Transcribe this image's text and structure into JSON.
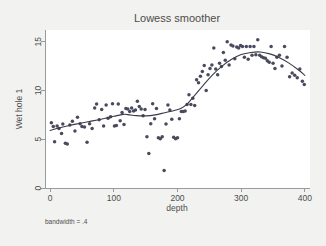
{
  "chart_data": {
    "type": "scatter",
    "title": "Lowess smoother",
    "xlabel": "depth",
    "ylabel": "Wet hole 1",
    "note": "bandwidth = .4",
    "xlim": [
      -8,
      408
    ],
    "ylim": [
      0,
      16.2
    ],
    "xticks": [
      0,
      100,
      200,
      300,
      400
    ],
    "yticks": [
      0,
      5,
      10,
      15
    ],
    "xtick_labels": [
      "0",
      "100",
      "200",
      "300",
      "400"
    ],
    "ytick_labels": [
      "0",
      "5",
      "10",
      "15"
    ],
    "grid": false,
    "legend": "none",
    "marker_color": "#4a4a5e",
    "line_color": "#3a3a4a",
    "background_color": "#f2f2f0",
    "plot_background_color": "#ffffff",
    "axis_color": "#9a9a9a",
    "series": [
      {
        "name": "Wet hole 1",
        "type": "scatter",
        "points": [
          [
            2,
            6.7
          ],
          [
            5,
            6.3
          ],
          [
            7,
            4.75
          ],
          [
            11,
            6.35
          ],
          [
            14,
            6.1
          ],
          [
            18,
            5.6
          ],
          [
            20,
            6.55
          ],
          [
            24,
            4.6
          ],
          [
            27,
            4.5
          ],
          [
            31,
            6.45
          ],
          [
            35,
            6.85
          ],
          [
            39,
            5.85
          ],
          [
            43,
            7.25
          ],
          [
            47,
            6.6
          ],
          [
            50,
            6.3
          ],
          [
            54,
            6.25
          ],
          [
            58,
            4.7
          ],
          [
            62,
            6.6
          ],
          [
            66,
            6.1
          ],
          [
            70,
            8.2
          ],
          [
            73,
            8.6
          ],
          [
            77,
            7.0
          ],
          [
            81,
            8.05
          ],
          [
            84,
            6.35
          ],
          [
            88,
            8.5
          ],
          [
            91,
            7.15
          ],
          [
            95,
            7.3
          ],
          [
            98,
            8.65
          ],
          [
            101,
            6.35
          ],
          [
            104,
            6.4
          ],
          [
            107,
            8.6
          ],
          [
            110,
            6.9
          ],
          [
            113,
            7.75
          ],
          [
            116,
            6.5
          ],
          [
            119,
            8.15
          ],
          [
            122,
            8.1
          ],
          [
            125,
            7.85
          ],
          [
            128,
            8.2
          ],
          [
            131,
            7.9
          ],
          [
            134,
            8.0
          ],
          [
            137,
            8.9
          ],
          [
            140,
            8.35
          ],
          [
            143,
            8.1
          ],
          [
            146,
            7.4
          ],
          [
            149,
            8.05
          ],
          [
            152,
            5.25
          ],
          [
            155,
            3.55
          ],
          [
            158,
            6.6
          ],
          [
            161,
            8.65
          ],
          [
            164,
            7.1
          ],
          [
            167,
            8.15
          ],
          [
            170,
            5.15
          ],
          [
            173,
            5.05
          ],
          [
            176,
            5.25
          ],
          [
            179,
            1.8
          ],
          [
            182,
            6.55
          ],
          [
            185,
            8.5
          ],
          [
            188,
            8.0
          ],
          [
            191,
            7.05
          ],
          [
            194,
            5.2
          ],
          [
            197,
            5.05
          ],
          [
            200,
            5.15
          ],
          [
            203,
            7.1
          ],
          [
            206,
            7.85
          ],
          [
            209,
            7.85
          ],
          [
            212,
            7.9
          ],
          [
            215,
            8.55
          ],
          [
            218,
            9.55
          ],
          [
            221,
            8.55
          ],
          [
            224,
            9.2
          ],
          [
            227,
            8.45
          ],
          [
            230,
            11.1
          ],
          [
            233,
            10.8
          ],
          [
            236,
            11.45
          ],
          [
            239,
            11.95
          ],
          [
            242,
            12.55
          ],
          [
            245,
            10.0
          ],
          [
            248,
            11.6
          ],
          [
            251,
            12.25
          ],
          [
            254,
            12.6
          ],
          [
            257,
            14.35
          ],
          [
            260,
            12.2
          ],
          [
            263,
            11.6
          ],
          [
            266,
            12.8
          ],
          [
            269,
            12.45
          ],
          [
            272,
            13.9
          ],
          [
            275,
            13.1
          ],
          [
            278,
            15.0
          ],
          [
            281,
            12.6
          ],
          [
            284,
            14.65
          ],
          [
            287,
            14.55
          ],
          [
            290,
            13.25
          ],
          [
            293,
            14.45
          ],
          [
            296,
            14.35
          ],
          [
            299,
            14.6
          ],
          [
            302,
            14.5
          ],
          [
            305,
            13.4
          ],
          [
            308,
            14.5
          ],
          [
            311,
            13.2
          ],
          [
            314,
            14.5
          ],
          [
            317,
            13.6
          ],
          [
            320,
            14.5
          ],
          [
            323,
            13.65
          ],
          [
            326,
            15.2
          ],
          [
            329,
            13.6
          ],
          [
            332,
            13.45
          ],
          [
            335,
            13.35
          ],
          [
            338,
            13.3
          ],
          [
            341,
            13.05
          ],
          [
            344,
            12.9
          ],
          [
            347,
            14.5
          ],
          [
            350,
            12.8
          ],
          [
            353,
            12.25
          ],
          [
            356,
            13.4
          ],
          [
            360,
            13.6
          ],
          [
            364,
            12.5
          ],
          [
            368,
            14.5
          ],
          [
            372,
            13.4
          ],
          [
            376,
            11.4
          ],
          [
            380,
            11.8
          ],
          [
            384,
            11.55
          ],
          [
            388,
            11.3
          ],
          [
            392,
            12.2
          ],
          [
            396,
            10.95
          ],
          [
            399,
            10.6
          ]
        ]
      },
      {
        "name": "lowess",
        "type": "line",
        "points": [
          [
            0,
            5.9
          ],
          [
            20,
            6.25
          ],
          [
            40,
            6.55
          ],
          [
            60,
            6.8
          ],
          [
            80,
            7.05
          ],
          [
            100,
            7.35
          ],
          [
            115,
            7.55
          ],
          [
            125,
            7.5
          ],
          [
            135,
            7.42
          ],
          [
            150,
            7.4
          ],
          [
            165,
            7.5
          ],
          [
            180,
            7.72
          ],
          [
            195,
            7.95
          ],
          [
            205,
            8.15
          ],
          [
            215,
            8.6
          ],
          [
            225,
            9.35
          ],
          [
            240,
            10.5
          ],
          [
            255,
            11.6
          ],
          [
            270,
            12.5
          ],
          [
            285,
            13.2
          ],
          [
            300,
            13.68
          ],
          [
            315,
            13.9
          ],
          [
            330,
            13.95
          ],
          [
            345,
            13.75
          ],
          [
            360,
            13.35
          ],
          [
            375,
            12.8
          ],
          [
            390,
            12.1
          ],
          [
            400,
            11.55
          ]
        ]
      }
    ]
  }
}
